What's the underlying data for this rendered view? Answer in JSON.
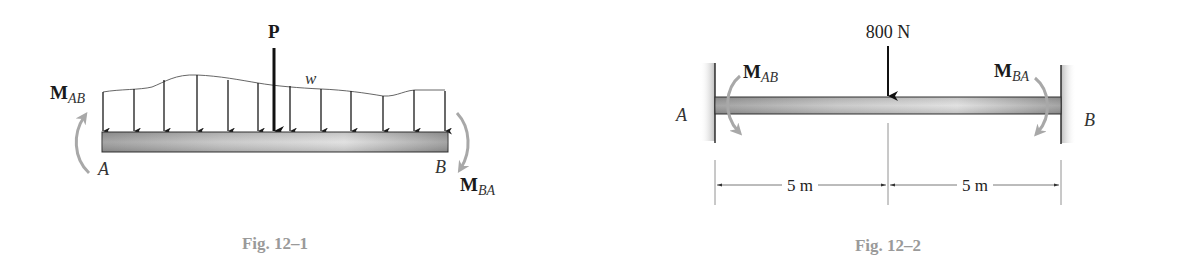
{
  "figures": [
    {
      "id": "fig-12-1",
      "caption": "Fig. 12–1",
      "description": "Beam AB with distributed load w, concentrated load P, and end moments",
      "labels": {
        "point_load": "P",
        "distributed_load": "w",
        "moment_left_main": "M",
        "moment_left_sub": "AB",
        "moment_right_main": "M",
        "moment_right_sub": "BA",
        "end_left": "A",
        "end_right": "B"
      }
    },
    {
      "id": "fig-12-2",
      "caption": "Fig. 12–2",
      "description": "Fixed-fixed beam AB with 800 N midspan load",
      "labels": {
        "point_load": "800 N",
        "moment_left_main": "M",
        "moment_left_sub": "AB",
        "moment_right_main": "M",
        "moment_right_sub": "BA",
        "end_left": "A",
        "end_right": "B",
        "dim_left": "5 m",
        "dim_right": "5 m"
      }
    }
  ],
  "colors": {
    "beam_dark": "#8a8a8a",
    "beam_light": "#d8d8d8",
    "moment_arrow": "#a8a8a8",
    "caption": "#9a9a9a",
    "line": "#1a1a1a"
  }
}
